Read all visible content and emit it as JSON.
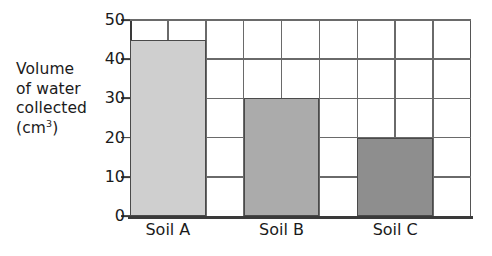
{
  "chart_data": {
    "type": "bar",
    "title": "",
    "xlabel": "",
    "ylabel": "Volume of water collected (cm3)",
    "ylabel_lines": [
      "Volume",
      "of water",
      "collected",
      "(cm"
    ],
    "ylabel_sup": "3",
    "ylabel_close": ")",
    "categories": [
      "Soil A",
      "Soil B",
      "Soil C"
    ],
    "values": [
      45,
      30,
      20
    ],
    "bar_colors": [
      "#cfcfcf",
      "#ababab",
      "#8e8e8e"
    ],
    "ylim": [
      0,
      50
    ],
    "yticks": [
      0,
      10,
      20,
      30,
      40,
      50
    ],
    "ytick_labels": [
      "0",
      "10",
      "20",
      "30",
      "40",
      "50"
    ],
    "grid": true,
    "grid_horizontal_count": 6,
    "grid_vertical_count": 9,
    "legend": "none",
    "legend_position": "none",
    "axis_color": "#3a3a3a",
    "grid_color": "#6a6a6a",
    "background": "#ffffff"
  }
}
